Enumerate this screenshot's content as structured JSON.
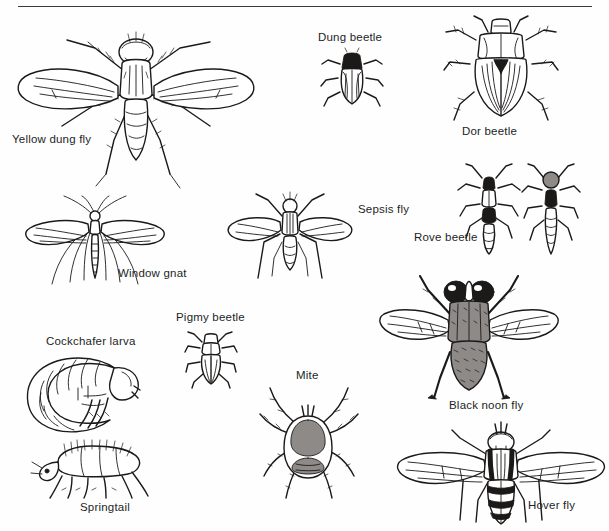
{
  "plate": {
    "title": "Insects associated with dung",
    "background_color": "#fefefe",
    "ink_color": "#1c1a19",
    "width": 609,
    "height": 531,
    "has_top_rule": true,
    "style": "black and white scientific line engraving"
  },
  "figures": [
    {
      "id": "yellow-dung-fly",
      "label": "Yellow dung fly",
      "label_x": 12,
      "label_y": 134,
      "fig_x": 10,
      "fig_y": 18,
      "fig_w": 250,
      "fig_h": 175,
      "kind": "fly"
    },
    {
      "id": "dung-beetle",
      "label": "Dung beetle",
      "label_x": 318,
      "label_y": 32,
      "fig_x": 320,
      "fig_y": 46,
      "fig_w": 62,
      "fig_h": 62,
      "kind": "beetle"
    },
    {
      "id": "dor-beetle",
      "label": "Dor beetle",
      "label_x": 462,
      "label_y": 126,
      "fig_x": 442,
      "fig_y": 16,
      "fig_w": 116,
      "fig_h": 106,
      "kind": "beetle"
    },
    {
      "id": "sepsis-fly",
      "label": "Sepsis fly",
      "label_x": 358,
      "label_y": 204,
      "fig_x": 224,
      "fig_y": 190,
      "fig_w": 130,
      "fig_h": 90,
      "kind": "fly"
    },
    {
      "id": "rove-beetle",
      "label": "Rove beetle",
      "label_x": 414,
      "label_y": 232,
      "fig_x": 456,
      "fig_y": 164,
      "fig_w": 130,
      "fig_h": 92,
      "kind": "beetle-pair"
    },
    {
      "id": "window-gnat",
      "label": "Window gnat",
      "label_x": 118,
      "label_y": 268,
      "fig_x": 18,
      "fig_y": 196,
      "fig_w": 150,
      "fig_h": 90,
      "kind": "gnat"
    },
    {
      "id": "pigmy-beetle",
      "label": "Pigmy beetle",
      "label_x": 176,
      "label_y": 312,
      "fig_x": 184,
      "fig_y": 330,
      "fig_w": 52,
      "fig_h": 56,
      "kind": "beetle"
    },
    {
      "id": "cockchafer-larva",
      "label": "Cockchafer larva",
      "label_x": 46,
      "label_y": 336,
      "fig_x": 22,
      "fig_y": 350,
      "fig_w": 120,
      "fig_h": 82,
      "kind": "larva"
    },
    {
      "id": "springtail",
      "label": "Springtail",
      "label_x": 80,
      "label_y": 502,
      "fig_x": 28,
      "fig_y": 440,
      "fig_w": 122,
      "fig_h": 58,
      "kind": "springtail"
    },
    {
      "id": "mite",
      "label": "Mite",
      "label_x": 296,
      "label_y": 370,
      "fig_x": 258,
      "fig_y": 386,
      "fig_w": 102,
      "fig_h": 112,
      "kind": "mite"
    },
    {
      "id": "black-noon-fly",
      "label": "Black noon fly",
      "label_x": 449,
      "label_y": 400,
      "fig_x": 378,
      "fig_y": 276,
      "fig_w": 180,
      "fig_h": 122,
      "kind": "fly"
    },
    {
      "id": "hover-fly",
      "label": "Hover fly",
      "label_x": 528,
      "label_y": 500,
      "fig_x": 398,
      "fig_y": 424,
      "fig_w": 206,
      "fig_h": 102,
      "kind": "fly"
    }
  ]
}
